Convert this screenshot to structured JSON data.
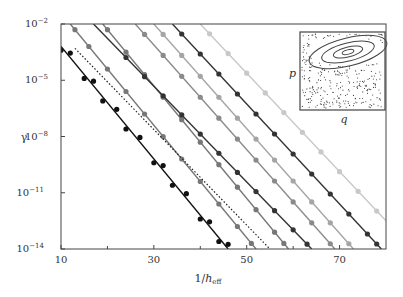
{
  "chart_data": {
    "type": "line",
    "title": "",
    "xlabel": "1/h_eff",
    "xlabel_main": "1/",
    "xlabel_var": "h",
    "xlabel_sub": "eff",
    "ylabel": "γ",
    "yscale": "log",
    "xlim": [
      10,
      80
    ],
    "ylim_log10": [
      -14,
      -2
    ],
    "grid": false,
    "x_ticks": [
      10,
      30,
      50,
      70
    ],
    "x_tick_labels": [
      "10",
      "30",
      "50",
      "70"
    ],
    "y_ticks_log10": [
      -2,
      -5,
      -8,
      -11,
      -14
    ],
    "y_tick_labels": [
      "10",
      "10",
      "10",
      "10",
      "10"
    ],
    "y_tick_exps": [
      "−2",
      "−5",
      "−8",
      "−11",
      "−14"
    ],
    "series": [
      {
        "name": "series-1",
        "color": "#111111",
        "style": "solid",
        "markers": true,
        "x0": 10,
        "logy0": -3.2,
        "x1": 46,
        "logy1": -14,
        "points_x": [
          10,
          12,
          15,
          17,
          19,
          22,
          24,
          27,
          30,
          32,
          34,
          37,
          40,
          42,
          44,
          46
        ]
      },
      {
        "name": "series-2",
        "color": "#777777",
        "style": "solid",
        "markers": true,
        "x0": 12,
        "logy0": -2,
        "x1": 52,
        "logy1": -14,
        "points_x": [
          13,
          16,
          20,
          24,
          28,
          32,
          36,
          40,
          44,
          48,
          51
        ]
      },
      {
        "name": "dotted-reference",
        "color": "#222222",
        "style": "dotted",
        "markers": false,
        "x0": 13,
        "logy0": -3.3,
        "x1": 55,
        "logy1": -14
      },
      {
        "name": "series-3",
        "color": "#777777",
        "style": "solid",
        "markers": true,
        "x0": 19,
        "logy0": -2,
        "x1": 59,
        "logy1": -14,
        "points_x": [
          20,
          24,
          28,
          32,
          36,
          40,
          44,
          48,
          52,
          56,
          58
        ]
      },
      {
        "name": "series-4",
        "color": "#333333",
        "style": "solid",
        "markers": true,
        "x0": 17,
        "logy0": -2,
        "x1": 64,
        "logy1": -14,
        "points_x": [
          24,
          28,
          32,
          36,
          40,
          44,
          48,
          52,
          56,
          60,
          63
        ]
      },
      {
        "name": "series-5",
        "color": "#8a8a8a",
        "style": "solid",
        "markers": true,
        "x0": 26,
        "logy0": -2,
        "x1": 69,
        "logy1": -14,
        "points_x": [
          28,
          32,
          36,
          40,
          44,
          48,
          52,
          56,
          60,
          64,
          68
        ]
      },
      {
        "name": "series-6",
        "color": "#a5a5a5",
        "style": "solid",
        "markers": true,
        "x0": 30,
        "logy0": -2,
        "x1": 73,
        "logy1": -14,
        "points_x": [
          32,
          36,
          40,
          44,
          48,
          52,
          56,
          60,
          64,
          68,
          72
        ]
      },
      {
        "name": "series-7",
        "color": "#333333",
        "style": "solid",
        "markers": true,
        "x0": 34,
        "logy0": -2,
        "x1": 79,
        "logy1": -14,
        "points_x": [
          36,
          40,
          44,
          48,
          52,
          56,
          60,
          64,
          68,
          72,
          76,
          78
        ]
      },
      {
        "name": "series-8",
        "color": "#c8c8c8",
        "style": "solid",
        "markers": true,
        "x0": 40,
        "logy0": -2,
        "x1": 80,
        "logy1": -12.5,
        "points_x": [
          42,
          46,
          50,
          54,
          58,
          62,
          66,
          70,
          74,
          78
        ]
      }
    ],
    "inset": {
      "description": "phase-space portrait with nested elliptical contours over scattered points",
      "xlabel": "q",
      "ylabel": "p",
      "contours": 4
    }
  }
}
